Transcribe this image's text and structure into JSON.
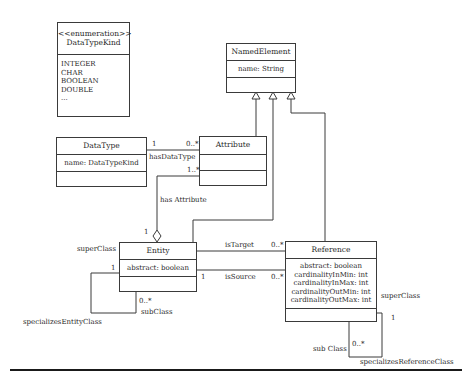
{
  "diagram": {
    "type": "UML class diagram",
    "classes": {
      "enumeration": {
        "stereotype": "<<enumeration>>",
        "name": "DataTypeKind",
        "literals": [
          "INTEGER",
          "CHAR",
          "BOOLEAN",
          "DOUBLE",
          "..."
        ]
      },
      "named_element": {
        "name": "NamedElement",
        "attributes": [
          "name: String"
        ]
      },
      "data_type": {
        "name": "DataType",
        "attributes": [
          "name: DataTypeKind"
        ]
      },
      "attribute": {
        "name": "Attribute",
        "attributes": []
      },
      "entity": {
        "name": "Entity",
        "attributes": [
          "abstract: boolean"
        ]
      },
      "reference": {
        "name": "Reference",
        "attributes": [
          "abstract: boolean",
          "cardinalityInMin: int",
          "cardinalityInMax: int",
          "cardinalityOutMin: int",
          "cardinalityOutMax: int"
        ]
      }
    },
    "associations": {
      "has_data_type": {
        "label": "hasDataType",
        "mult_datatype": "1",
        "mult_attribute": "0..*"
      },
      "has_attribute": {
        "label": "has Attribute",
        "mult_attribute": "1..*",
        "mult_entity": "1"
      },
      "is_target": {
        "label": "isTarget",
        "mult_reference": "0..*"
      },
      "is_source": {
        "label": "isSource",
        "mult_entity": "1",
        "mult_reference": "0..*"
      },
      "specializes_entity": {
        "label": "specializesEntityClass",
        "super_role": "superClass",
        "super_mult": "1",
        "sub_role": "subClass",
        "sub_mult": "0..*"
      },
      "specializes_reference": {
        "label": "specializesReferenceClass",
        "super_role": "superClass",
        "super_mult": "1",
        "sub_role": "sub Class",
        "sub_mult": "0..*"
      }
    },
    "generalizations": [
      "Attribute -> NamedElement",
      "Entity -> NamedElement",
      "Reference -> NamedElement"
    ]
  }
}
